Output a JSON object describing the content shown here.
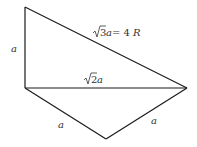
{
  "diagram": {
    "vertices": {
      "top_left": [
        25,
        7
      ],
      "mid_left": [
        25,
        88
      ],
      "right": [
        187,
        88
      ],
      "bottom": [
        106,
        139
      ]
    },
    "edges": [
      {
        "id": "left-vertical",
        "from": "top_left",
        "to": "mid_left",
        "label": "a"
      },
      {
        "id": "hypotenuse",
        "from": "top_left",
        "to": "right",
        "label": "√3a = 4R"
      },
      {
        "id": "middle-horizontal",
        "from": "mid_left",
        "to": "right",
        "label": "√2a"
      },
      {
        "id": "lower-left",
        "from": "mid_left",
        "to": "bottom",
        "label": "a"
      },
      {
        "id": "lower-right",
        "from": "bottom",
        "to": "right",
        "label": "a"
      }
    ],
    "labels": {
      "left_side": "a",
      "hypotenuse_coef": "3",
      "hypotenuse_var": "a",
      "hypotenuse_eq": " = 4",
      "hypotenuse_R": "R",
      "middle_coef": "2",
      "middle_var": "a",
      "lower_left": "a",
      "lower_right": "a"
    },
    "colors": {
      "line": "#1a1a1a",
      "text": "#333333",
      "background": "#ffffff"
    }
  }
}
